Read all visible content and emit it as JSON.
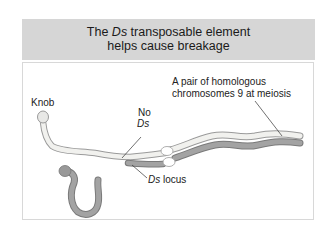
{
  "header": {
    "title_prefix": "The ",
    "title_italic": "Ds",
    "title_suffix": " transposable element",
    "title_line2": "helps cause breakage"
  },
  "labels": {
    "knob": "Knob",
    "no_ds_line1": "No",
    "no_ds_line2": "Ds",
    "pair_line1": "A pair of homologous",
    "pair_line2": "chromosomes 9 at meiosis",
    "ds_locus_italic": "Ds",
    "ds_locus_rest": " locus"
  },
  "colors": {
    "header_bg": "#d6d6d6",
    "panel_border": "#d8d8d8",
    "chromosome_light_fill": "#f1f1ee",
    "chromosome_light_stroke": "#9a9a9a",
    "chromosome_dark_fill": "#a3a3a3",
    "chromosome_dark_stroke": "#7a7a7a",
    "synapse_fill": "#ffffff"
  }
}
